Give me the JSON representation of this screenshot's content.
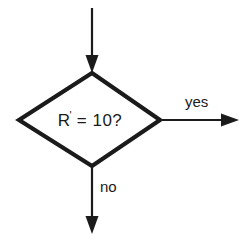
{
  "diagram": {
    "type": "flowchart-decision",
    "background_color": "#ffffff",
    "stroke_color": "#1b1b1b",
    "text_color": "#1b1b1b",
    "decision": {
      "shape": "diamond",
      "condition_main": "R",
      "condition_prime": "'",
      "condition_rest": " = 10?",
      "full_text": "R' = 10?"
    },
    "branches": {
      "yes_label": "yes",
      "no_label": "no"
    },
    "connectors": {
      "input_arrow": "arrow-down-into-decision",
      "yes_arrow": "arrow-right-out-of-decision",
      "no_arrow": "arrow-down-out-of-decision"
    }
  }
}
